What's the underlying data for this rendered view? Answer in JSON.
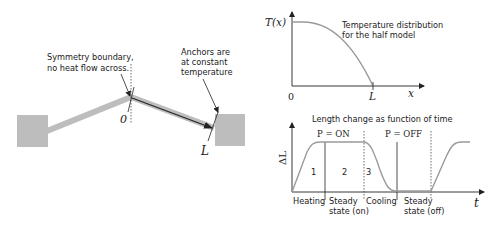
{
  "left_figure": {
    "symmetry_note": [
      "Symmetry boundary,",
      "no heat flow across."
    ],
    "anchor_note": [
      "Anchors are",
      "at constant",
      "temperature"
    ],
    "origin_label": "0",
    "end_label": "L",
    "colors": {
      "beam": "#bdbdbd",
      "anchor": "#bdbdbd",
      "line": "#222222"
    }
  },
  "temperature_plot": {
    "y_label": "T(x)",
    "x_label": "x",
    "x_ticks": [
      "0",
      "L"
    ],
    "caption": [
      "Temperature distribution",
      "for the half model"
    ]
  },
  "length_plot": {
    "title": "Length change as function of time",
    "y_label": "ΔL",
    "x_label": "t",
    "power_on": "P = ON",
    "power_off": "P = OFF",
    "phase_numbers": [
      "1",
      "2",
      "3"
    ],
    "phases": [
      {
        "line1": "Heating",
        "line2": ""
      },
      {
        "line1": "Steady",
        "line2": "state (on)"
      },
      {
        "line1": "Cooling",
        "line2": ""
      },
      {
        "line1": "Steady",
        "line2": "state (off)"
      }
    ],
    "colors": {
      "curve": "#9a9a9a",
      "axis": "#222222"
    }
  }
}
